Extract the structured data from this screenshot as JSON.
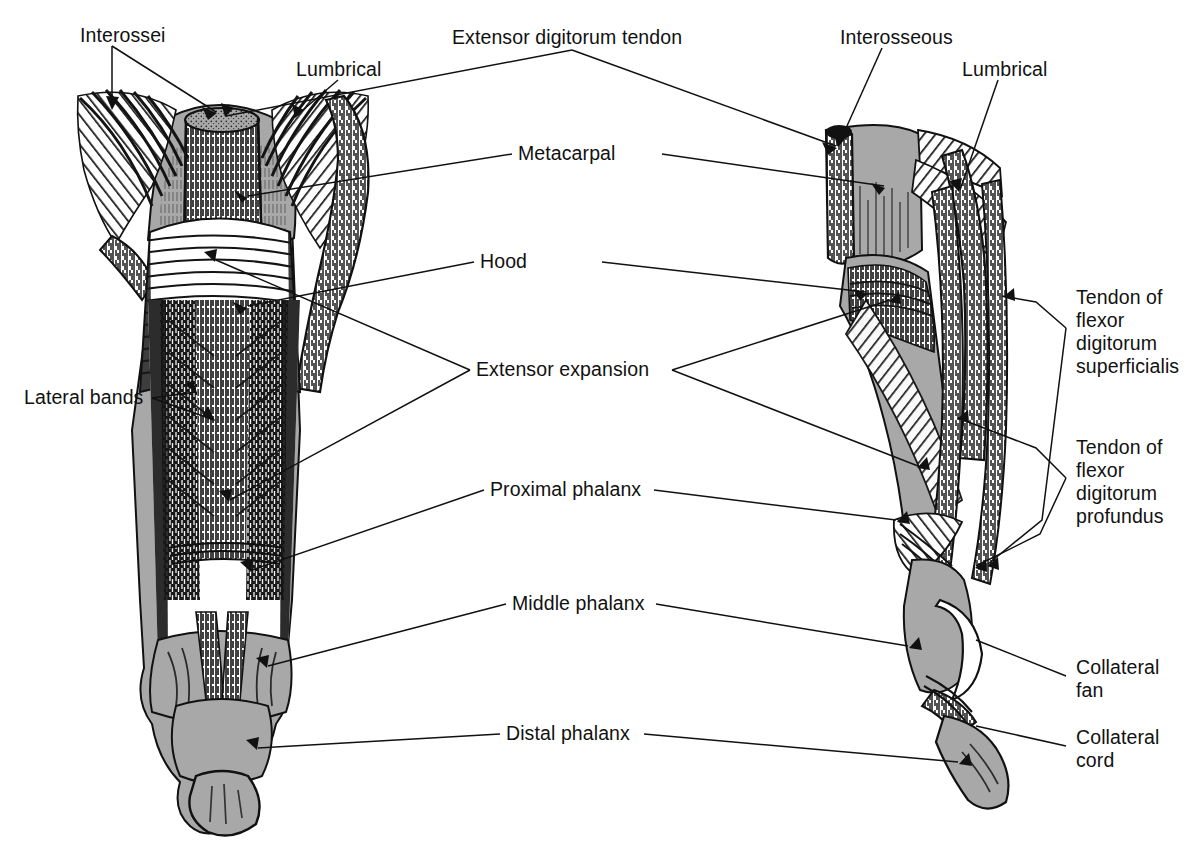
{
  "figure": {
    "views": [
      {
        "name": "dorsal-view",
        "position": "left"
      },
      {
        "name": "lateral-view",
        "position": "right"
      }
    ],
    "ink_color": "#111111",
    "fill_gray": "#a8a8a8",
    "fill_gray_dark": "#8d8d8d",
    "background": "#ffffff"
  },
  "labels": {
    "interossei": "Interossei",
    "lumbrical_left": "Lumbrical",
    "extensor_digitorum_tendon": "Extensor digitorum tendon",
    "interosseous": "Interosseous",
    "lumbrical_right": "Lumbrical",
    "metacarpal": "Metacarpal",
    "hood": "Hood",
    "extensor_expansion": "Extensor expansion",
    "proximal_phalanx": "Proximal phalanx",
    "middle_phalanx": "Middle phalanx",
    "distal_phalanx": "Distal phalanx",
    "lateral_bands": "Lateral bands",
    "tendon_fds": "Tendon of\nflexor\ndigitorum\nsuperficialis",
    "tendon_fdp": "Tendon of\nflexor\ndigitorum\nprofundus",
    "collateral_fan": "Collateral\nfan",
    "collateral_cord": "Collateral\ncord"
  }
}
